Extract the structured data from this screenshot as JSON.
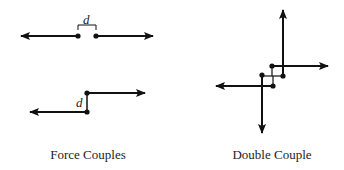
{
  "left_panel": {
    "caption": "Force Couples",
    "top_diagram": {
      "distance_label": "d"
    },
    "bottom_diagram": {
      "distance_label": "d"
    }
  },
  "right_panel": {
    "caption": "Double Couple"
  },
  "colors": {
    "stroke": "#111111",
    "background": "#ffffff"
  }
}
